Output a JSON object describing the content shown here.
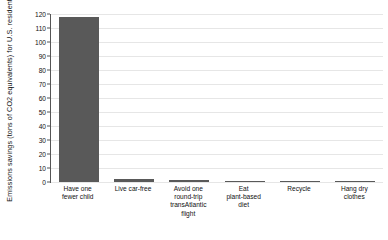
{
  "chart_data": {
    "type": "bar",
    "title": "",
    "subtitle": "",
    "xlabel": "",
    "ylabel": "Emissions savings (tons of CO2 equivalents) for U.S. residents",
    "ylim": [
      0,
      120
    ],
    "ytick_step": 10,
    "yticks": [
      0,
      10,
      20,
      30,
      40,
      50,
      60,
      70,
      80,
      90,
      100,
      110,
      120
    ],
    "ytick_labels": [
      "0",
      "10",
      "20",
      "30",
      "40",
      "50",
      "60",
      "70",
      "80",
      "90",
      "100",
      "110",
      "120"
    ],
    "grid": true,
    "grid_axis": "y",
    "legend": false,
    "legend_position": "none",
    "bar_color": "#595959",
    "grid_color": "#e6e6e6",
    "axis_color": "#555555",
    "categories": [
      "Have one fewer child",
      "Live car-free",
      "Avoid one round-trip transAtlantic flight",
      "Eat plant-based diet",
      "Recycle",
      "Hang dry clothes"
    ],
    "category_lines": [
      [
        "Have one",
        "fewer child"
      ],
      [
        "Live car-free"
      ],
      [
        "Avoid one",
        "round-trip",
        "transAtlantic",
        "flight"
      ],
      [
        "Eat",
        "plant-based",
        "diet"
      ],
      [
        "Recycle"
      ],
      [
        "Hang dry",
        "clothes"
      ]
    ],
    "values": [
      117.7,
      2.4,
      1.6,
      0.8,
      0.2,
      0.2
    ]
  }
}
